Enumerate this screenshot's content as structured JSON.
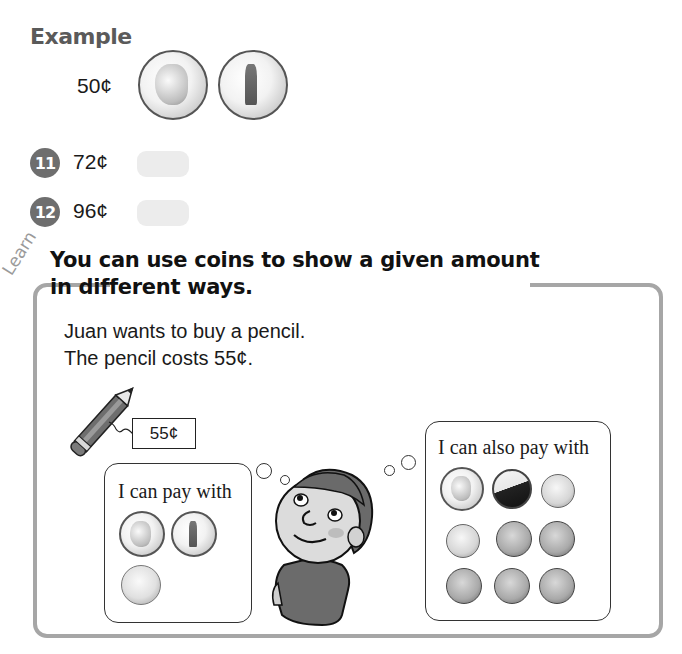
{
  "example": {
    "title": "Example",
    "amount": "50¢",
    "coins": [
      "quarter",
      "quarter-new-york"
    ]
  },
  "exercises": [
    {
      "number": "11",
      "amount": "72¢",
      "answer": ""
    },
    {
      "number": "12",
      "amount": "96¢",
      "answer": ""
    }
  ],
  "learn": {
    "label": "Learn",
    "headline_line1": "You can use coins to show a given amount",
    "headline_line2": "in different ways.",
    "body_line1": "Juan wants to buy a pencil.",
    "body_line2": "The pencil costs 55¢.",
    "price_tag": "55¢",
    "bubble_left": {
      "text": "I can pay with",
      "coins": [
        "quarter",
        "quarter-new-york",
        "nickel"
      ]
    },
    "bubble_right": {
      "text": "I can also pay with",
      "coins": [
        "quarter",
        "nickel",
        "dime",
        "dime",
        "penny",
        "penny",
        "penny",
        "penny",
        "penny"
      ]
    }
  },
  "colors": {
    "frame": "#a6a6a6",
    "badge": "#6e6e6e",
    "answer_box": "#ececec"
  }
}
